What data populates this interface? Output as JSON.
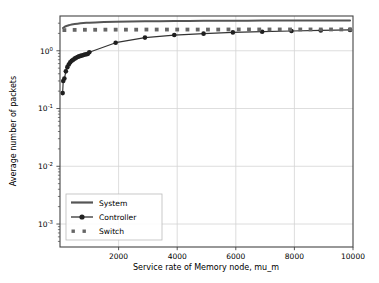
{
  "chart_data": {
    "type": "line",
    "title": "",
    "xlabel": "Service rate of Memory node, mu_m",
    "ylabel": "Average number of packets",
    "yscale": "log",
    "xlim": [
      0,
      10000
    ],
    "ylim": [
      0.0004,
      4.0
    ],
    "grid": true,
    "xticks": [
      2000,
      4000,
      6000,
      8000,
      10000
    ],
    "xticklabels": [
      "2000",
      "4000",
      "6000",
      "8000",
      "10000"
    ],
    "yticks": [
      1,
      0.1,
      0.01,
      0.001
    ],
    "yticklabels": [
      "10⁰",
      "10⁻¹",
      "10⁻²",
      "10⁻³"
    ],
    "ytick_mantissa": "10",
    "ytick_exponents": [
      "0",
      "-1",
      "-2",
      "-3"
    ],
    "legend_position": "lower left",
    "legend_entries": [
      "System",
      "Controller",
      "Switch"
    ],
    "colors": {
      "system": "#555555",
      "controller": "#333333",
      "switch": "#666666",
      "grid": "#d4d4d4",
      "axis": "#444444",
      "background": "#ffffff"
    },
    "series": [
      {
        "name": "System",
        "style": "solid-line",
        "marker": "none",
        "color": "#555555",
        "x": [
          100,
          150,
          200,
          250,
          300,
          350,
          400,
          500,
          600,
          700,
          800,
          900,
          1000,
          1200,
          1500,
          1900,
          2400,
          2900,
          3400,
          3900,
          4400,
          4900,
          5400,
          5900,
          6400,
          6900,
          7400,
          7900,
          8400,
          8900,
          9400,
          9900
        ],
        "y": [
          2.48,
          2.58,
          2.66,
          2.72,
          2.77,
          2.81,
          2.85,
          2.9,
          2.95,
          2.99,
          3.02,
          3.05,
          3.07,
          3.1,
          3.14,
          3.18,
          3.21,
          3.24,
          3.26,
          3.27,
          3.29,
          3.3,
          3.31,
          3.32,
          3.32,
          3.33,
          3.33,
          3.34,
          3.34,
          3.35,
          3.35,
          3.35
        ]
      },
      {
        "name": "Controller",
        "style": "solid-line-with-markers",
        "marker": "circle",
        "color": "#333333",
        "x": [
          90,
          110,
          150,
          200,
          250,
          300,
          350,
          400,
          450,
          500,
          550,
          600,
          650,
          700,
          750,
          800,
          850,
          900,
          950,
          1000,
          1900,
          2900,
          3900,
          4900,
          5900,
          6900,
          7900,
          8900,
          9900
        ],
        "y": [
          0.185,
          0.3,
          0.33,
          0.44,
          0.52,
          0.58,
          0.63,
          0.67,
          0.7,
          0.73,
          0.755,
          0.78,
          0.8,
          0.815,
          0.83,
          0.845,
          0.86,
          0.87,
          0.885,
          0.94,
          1.38,
          1.69,
          1.87,
          1.98,
          2.08,
          2.14,
          2.2,
          2.25,
          2.3
        ]
      },
      {
        "name": "Switch",
        "style": "dotted-squares",
        "marker": "square",
        "color": "#666666",
        "x": [
          150,
          500,
          850,
          1200,
          1550,
          1900,
          2250,
          2600,
          2950,
          3300,
          3650,
          4000,
          4350,
          4700,
          5050,
          5400,
          5750,
          6100,
          6450,
          6800,
          7150,
          7500,
          7850,
          8200,
          8550,
          8900,
          9250,
          9600,
          9900
        ],
        "y": [
          2.28,
          2.3,
          2.31,
          2.31,
          2.32,
          2.32,
          2.32,
          2.32,
          2.33,
          2.33,
          2.33,
          2.33,
          2.33,
          2.33,
          2.33,
          2.33,
          2.34,
          2.34,
          2.34,
          2.34,
          2.34,
          2.34,
          2.34,
          2.34,
          2.34,
          2.34,
          2.34,
          2.34,
          2.34
        ]
      }
    ]
  }
}
